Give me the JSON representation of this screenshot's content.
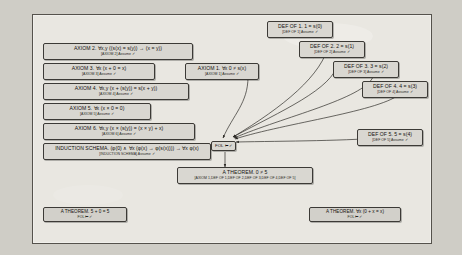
{
  "canvas": {
    "background_color": "#e9e7e1",
    "border_color": "#55524c",
    "outer_background_color": "#cfcdc6"
  },
  "nodes": {
    "axiom2": {
      "formula": "AXIOM 2. ∀x,y ((s(x) = s(y)) → (x = y))",
      "justification": "[AXIOM 2] Assume ✓"
    },
    "axiom3": {
      "formula": "AXIOM 3. ∀x (x + 0 = x)",
      "justification": "[AXIOM 3] Assume ✓"
    },
    "axiom4": {
      "formula": "AXIOM 4. ∀x,y (x + (s(y)) = s(x + y))",
      "justification": "[AXIOM 4] Assume ✓"
    },
    "axiom5": {
      "formula": "AXIOM 5. ∀x (x × 0 = 0)",
      "justification": "[AXIOM 5] Assume ✓"
    },
    "axiom6": {
      "formula": "AXIOM 6. ∀x,y (x × (s(y)) = (x × y) + x)",
      "justification": "[AXIOM 6] Assume ✓"
    },
    "induction": {
      "formula": "INDUCTION SCHEMA. (φ(0) ∧ ∀x (φ(x) → φ(s(x)))) → ∀x φ(x)",
      "justification": "[INDUCTION SCHEMA] Assume ✓"
    },
    "axiom1": {
      "formula": "AXIOM 1. ∀x 0 ≠ s(x)",
      "justification": "[AXIOM 1] Assume ✓"
    },
    "def1": {
      "formula": "DEF OF 1. 1 = s(0)",
      "justification": "[DEF OF 1] Assume ✓"
    },
    "def2": {
      "formula": "DEF OF 2. 2 = s(1)",
      "justification": "[DEF OF 2] Assume ✓"
    },
    "def3": {
      "formula": "DEF OF 3. 3 = s(2)",
      "justification": "[DEF OF 3] Assume ✓"
    },
    "def4": {
      "formula": "DEF OF 4. 4 = s(3)",
      "justification": "[DEF OF 4] Assume ✓"
    },
    "def5": {
      "formula": "DEF OF 5. 5 = s(4)",
      "justification": "[DEF OF 5] Assume ✓"
    },
    "fol_hub": {
      "label": "FOL ⊢ ✓"
    },
    "theorem_main": {
      "formula": "A THEOREM. 0 ≠ 5",
      "justification": "[AXIOM 1,DEF OF 1,DEF OF 2,DEF OF 3,DEF OF 4,DEF OF 5]"
    },
    "theorem_left": {
      "formula": "A THEOREM. 5 + 0 = 5",
      "justification": "FOL ⊢ ✓"
    },
    "theorem_right": {
      "formula": "A THEOREM. ∀x (0 + x = x)",
      "justification": "FOL ⊢ ✓"
    }
  }
}
